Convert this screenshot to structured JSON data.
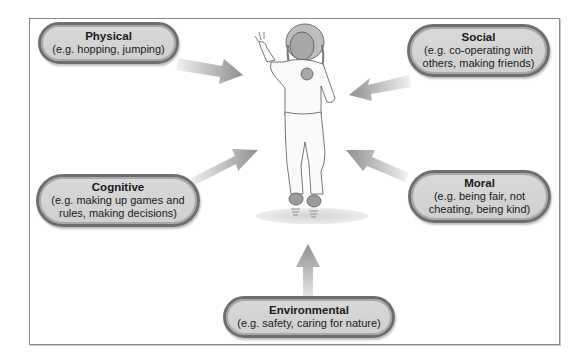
{
  "diagram": {
    "center": {
      "label": "child-jumping-illustration"
    },
    "nodes": [
      {
        "id": "physical",
        "title": "Physical",
        "desc": "(e.g. hopping, jumping)"
      },
      {
        "id": "social",
        "title": "Social",
        "desc": "(e.g. co-operating with others, making friends)"
      },
      {
        "id": "cognitive",
        "title": "Cognitive",
        "desc": "(e.g. making up games and rules, making decisions)"
      },
      {
        "id": "moral",
        "title": "Moral",
        "desc": "(e.g. being fair, not cheating, being kind)"
      },
      {
        "id": "environmental",
        "title": "Environmental",
        "desc": "(e.g. safety, caring for nature)"
      }
    ],
    "colors": {
      "pill_fill": "#d3d3d3",
      "pill_border": "#6e6e6e",
      "arrow": "#9a9a9a",
      "frame": "#8a8a8a"
    }
  }
}
